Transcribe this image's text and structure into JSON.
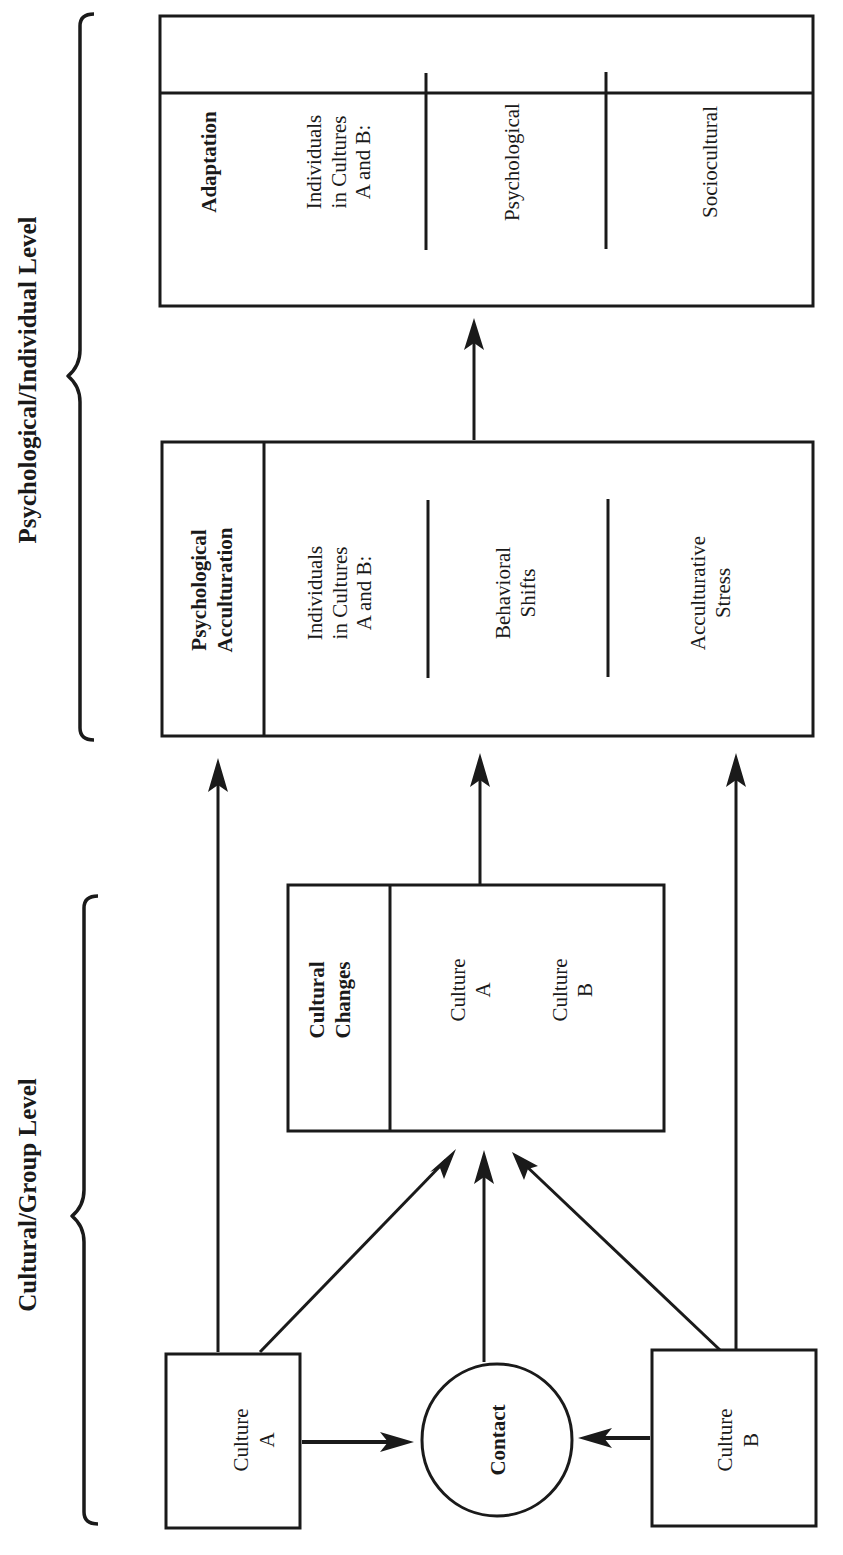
{
  "diagram": {
    "title": "",
    "orientation": "rotated -90deg (reads bottom-to-top)",
    "levels": [
      {
        "id": "psych_level",
        "label": "Psychological/Individual Level"
      },
      {
        "id": "cultural_level",
        "label": "Cultural/Group Level"
      }
    ],
    "nodes": {
      "culture_a": {
        "line1": "Culture",
        "line2": "A"
      },
      "culture_b": {
        "line1": "Culture",
        "line2": "B"
      },
      "contact": {
        "label": "Contact"
      },
      "cultural_changes": {
        "header_line1": "Cultural",
        "header_line2": "Changes",
        "items": [
          {
            "line1": "Culture",
            "line2": "A"
          },
          {
            "line1": "Culture",
            "line2": "B"
          }
        ]
      },
      "psychological_acculturation": {
        "header_line1": "Psychological",
        "header_line2": "Acculturation",
        "intro_line1": "Individuals",
        "intro_line2": "in Cultures",
        "intro_line3": "A and B:",
        "items": [
          {
            "line1": "Behavioral",
            "line2": "Shifts"
          },
          {
            "line1": "Acculturative",
            "line2": "Stress"
          }
        ]
      },
      "adaptation": {
        "header": "Adaptation",
        "intro_line1": "Individuals",
        "intro_line2": "in Cultures",
        "intro_line3": "A and B:",
        "items": [
          {
            "label": "Psychological"
          },
          {
            "label": "Sociocultural"
          }
        ]
      }
    },
    "edges": [
      {
        "from": "Culture A",
        "to": "Contact"
      },
      {
        "from": "Culture B",
        "to": "Contact"
      },
      {
        "from": "Culture A",
        "to": "Cultural Changes"
      },
      {
        "from": "Contact",
        "to": "Cultural Changes"
      },
      {
        "from": "Culture B",
        "to": "Cultural Changes"
      },
      {
        "from": "Culture A",
        "to": "Psychological Acculturation"
      },
      {
        "from": "Cultural Changes",
        "to": "Psychological Acculturation"
      },
      {
        "from": "Culture B",
        "to": "Psychological Acculturation"
      },
      {
        "from": "Psychological Acculturation",
        "to": "Adaptation"
      }
    ],
    "colors": {
      "ink": "#1a1a1a",
      "background": "#ffffff"
    }
  }
}
